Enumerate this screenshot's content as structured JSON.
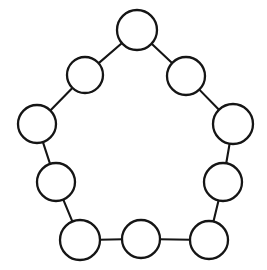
{
  "figure": {
    "width": 267,
    "height": 270,
    "background_color": "#ffffff",
    "stroke_color": "#151515",
    "node_fill_color": "#ffffff",
    "node_stroke_width": 2.3,
    "edge_stroke_width": 2.1
  },
  "chart_data": {
    "type": "diagram",
    "graph_type": "cycle",
    "node_count": 10,
    "edge_count": 10,
    "nodes": [
      {
        "id": "n1",
        "label": "",
        "x": 137,
        "y": 30,
        "r": 20
      },
      {
        "id": "n2",
        "label": "",
        "x": 186,
        "y": 76,
        "r": 19
      },
      {
        "id": "n3",
        "label": "",
        "x": 233,
        "y": 124,
        "r": 20
      },
      {
        "id": "n4",
        "label": "",
        "x": 223,
        "y": 182,
        "r": 19
      },
      {
        "id": "n5",
        "label": "",
        "x": 209,
        "y": 240,
        "r": 19
      },
      {
        "id": "n6",
        "label": "",
        "x": 141,
        "y": 239,
        "r": 19
      },
      {
        "id": "n7",
        "label": "",
        "x": 80,
        "y": 240,
        "r": 20
      },
      {
        "id": "n8",
        "label": "",
        "x": 56,
        "y": 182,
        "r": 19
      },
      {
        "id": "n9",
        "label": "",
        "x": 37,
        "y": 124,
        "r": 19
      },
      {
        "id": "n10",
        "label": "",
        "x": 85,
        "y": 75,
        "r": 18
      }
    ],
    "edges": [
      {
        "source": "n1",
        "target": "n2"
      },
      {
        "source": "n2",
        "target": "n3"
      },
      {
        "source": "n3",
        "target": "n4"
      },
      {
        "source": "n4",
        "target": "n5"
      },
      {
        "source": "n5",
        "target": "n6"
      },
      {
        "source": "n6",
        "target": "n7"
      },
      {
        "source": "n7",
        "target": "n8"
      },
      {
        "source": "n8",
        "target": "n9"
      },
      {
        "source": "n9",
        "target": "n10"
      },
      {
        "source": "n10",
        "target": "n1"
      }
    ]
  }
}
